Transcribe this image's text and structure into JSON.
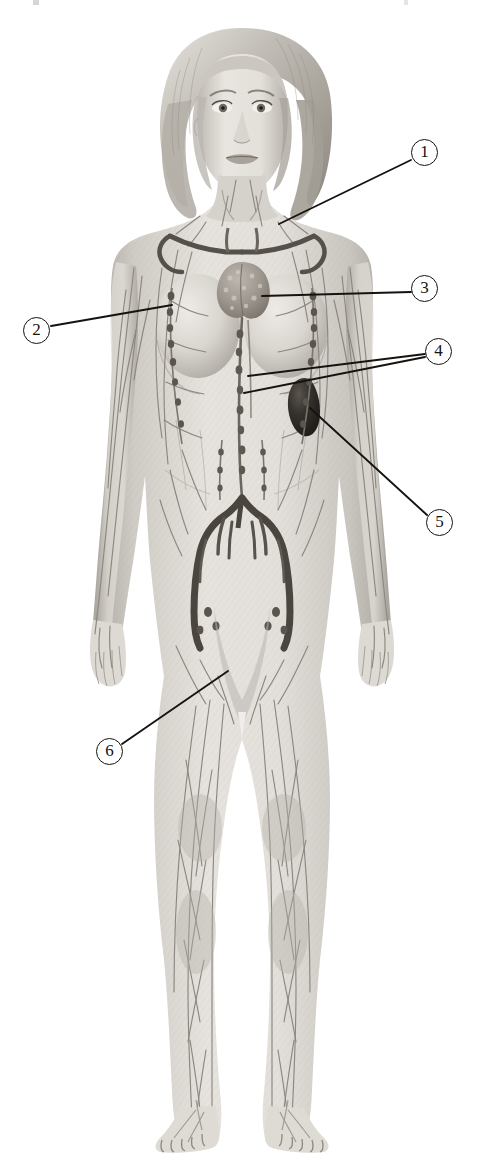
{
  "figure": {
    "view": "anterior",
    "background_color": "#ffffff",
    "width": 484,
    "height": 1159,
    "style": "grayscale medical illustration",
    "line_color": "#16120f"
  },
  "callouts": [
    {
      "id": "callout-1",
      "number": "1",
      "circle": {
        "cx": 425,
        "cy": 153
      },
      "target": "cervical / supraclavicular lymph nodes of the neck",
      "leaders": [
        {
          "x1": 411,
          "y1": 160,
          "x2": 279,
          "y2": 224
        }
      ]
    },
    {
      "id": "callout-2",
      "number": "2",
      "circle": {
        "cx": 37,
        "cy": 331
      },
      "target": "axillary lymph nodes",
      "leaders": [
        {
          "x1": 51,
          "y1": 326,
          "x2": 172,
          "y2": 305
        }
      ]
    },
    {
      "id": "callout-3",
      "number": "3",
      "circle": {
        "cx": 425,
        "cy": 289
      },
      "target": "thymus gland",
      "leaders": [
        {
          "x1": 411,
          "y1": 292,
          "x2": 262,
          "y2": 296
        }
      ]
    },
    {
      "id": "callout-4",
      "number": "4",
      "circle": {
        "cx": 439,
        "cy": 352
      },
      "target": "thoracic duct and lymphatic trunks",
      "leaders": [
        {
          "x1": 425,
          "y1": 354,
          "x2": 248,
          "y2": 376
        },
        {
          "x1": 425,
          "y1": 357,
          "x2": 244,
          "y2": 393
        }
      ]
    },
    {
      "id": "callout-5",
      "number": "5",
      "circle": {
        "cx": 440,
        "cy": 523
      },
      "target": "spleen",
      "leaders": [
        {
          "x1": 427,
          "y1": 515,
          "x2": 310,
          "y2": 408
        }
      ]
    },
    {
      "id": "callout-6",
      "number": "6",
      "circle": {
        "cx": 110,
        "cy": 752
      },
      "target": "superficial lymphatic vessels of the lower limb",
      "leaders": [
        {
          "x1": 122,
          "y1": 744,
          "x2": 228,
          "y2": 671
        }
      ]
    }
  ],
  "anatomy": {
    "skin_tone_light": "#e4e1dc",
    "skin_tone_mid": "#cdc9c3",
    "skin_tone_shadow": "#a9a49d",
    "hair_light": "#dedad4",
    "hair_mid": "#b7b2aa",
    "hair_dark": "#8d877f",
    "vessel_color": "#8a8580",
    "vessel_dark": "#5e5952",
    "trunk_dark": "#4d4944",
    "thymus_color": "#9a948c",
    "spleen_color": "#2e2b27",
    "labels": {
      "head": "head",
      "hair": "hair",
      "neck": "neck",
      "torso": "torso",
      "left_arm": "left arm",
      "right_arm": "right arm",
      "left_leg": "left leg",
      "right_leg": "right leg",
      "thymus": "thymus",
      "spleen": "spleen",
      "thoracic_duct": "thoracic duct",
      "pelvic_trunks": "pelvic lymphatic trunks",
      "clavicular_vessels": "subclavian lymphatic vessels",
      "axillary_nodes": "axillary lymph nodes",
      "inguinal_nodes": "inguinal lymph nodes"
    }
  }
}
